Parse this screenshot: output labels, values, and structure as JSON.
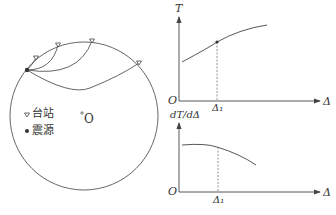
{
  "figure": {
    "earth": {
      "center_label": "O",
      "legend": [
        {
          "symbol": "triangle-down",
          "label": "台站"
        },
        {
          "symbol": "dot",
          "label": "震源"
        }
      ]
    },
    "top_plot": {
      "y_label": "T",
      "x_label": "Δ",
      "origin": "O",
      "marker_label": "Δ₁"
    },
    "bottom_plot": {
      "y_label": "dT/dΔ",
      "x_label": "Δ",
      "origin": "O",
      "marker_label": "Δ₁"
    }
  },
  "colors": {
    "line": "#444444",
    "text": "#333333"
  }
}
